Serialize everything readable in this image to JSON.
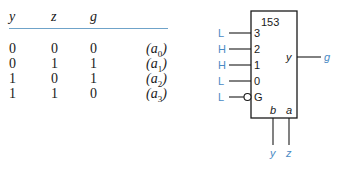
{
  "truth_table": {
    "headers": [
      "y",
      "z",
      "g"
    ],
    "rows": [
      {
        "y": "0",
        "z": "0",
        "g": "0",
        "label": "(a0)",
        "sub": "0"
      },
      {
        "y": "0",
        "z": "1",
        "g": "1",
        "label": "(a1)",
        "sub": "1"
      },
      {
        "y": "1",
        "z": "0",
        "g": "1",
        "label": "(a2)",
        "sub": "2"
      },
      {
        "y": "1",
        "z": "1",
        "g": "0",
        "label": "(a3)",
        "sub": "3"
      }
    ]
  },
  "chip": {
    "name": "153",
    "inputs": [
      {
        "pin": "3",
        "level": "L"
      },
      {
        "pin": "2",
        "level": "H"
      },
      {
        "pin": "1",
        "level": "H"
      },
      {
        "pin": "0",
        "level": "L"
      },
      {
        "pin": "G",
        "level": "L",
        "inverted": true
      }
    ],
    "output": {
      "pin": "y",
      "signal": "g"
    },
    "selects": [
      {
        "pin": "b",
        "signal": "y"
      },
      {
        "pin": "a",
        "signal": "z"
      }
    ],
    "colors": {
      "signal": "#4a8ac4",
      "line": "#1a1a1a",
      "rule": "#6fa3c9"
    }
  }
}
